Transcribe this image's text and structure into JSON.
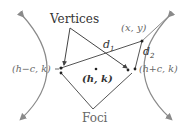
{
  "diagram": {
    "labels": {
      "vertices": "Vertices",
      "foci": "Foci",
      "point": "(x, y)",
      "center": "(h, k)",
      "left_focus": "(h−c, k)",
      "right_focus": "(h+c, k)",
      "d1": "d",
      "d1_sub": "1",
      "d2": "d",
      "d2_sub": "2"
    },
    "colors": {
      "curve": "#8a8a8a",
      "line": "#555555",
      "dot": "#222222",
      "text": "#666666",
      "text_dark": "#333333"
    }
  }
}
